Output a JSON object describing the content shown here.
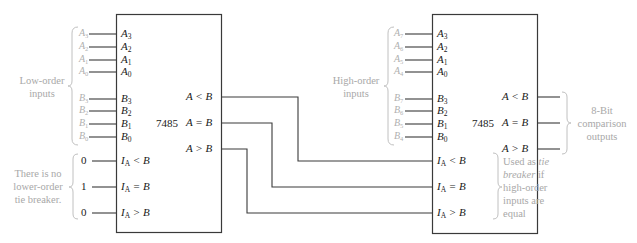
{
  "chips": [
    {
      "id": "low",
      "name": "7485",
      "inputs": [
        {
          "pin": "A",
          "sub": "3",
          "ext": "A",
          "ext_sub": "3"
        },
        {
          "pin": "A",
          "sub": "2",
          "ext": "A",
          "ext_sub": "2"
        },
        {
          "pin": "A",
          "sub": "1",
          "ext": "A",
          "ext_sub": "1"
        },
        {
          "pin": "A",
          "sub": "0",
          "ext": "A",
          "ext_sub": "0"
        },
        {
          "pin": "B",
          "sub": "3",
          "ext": "B",
          "ext_sub": "3"
        },
        {
          "pin": "B",
          "sub": "2",
          "ext": "B",
          "ext_sub": "2"
        },
        {
          "pin": "B",
          "sub": "1",
          "ext": "B",
          "ext_sub": "1"
        },
        {
          "pin": "B",
          "sub": "0",
          "ext": "B",
          "ext_sub": "0"
        }
      ],
      "cascade_inputs": [
        {
          "label": "I",
          "sub": "A",
          "op": "< B",
          "value": "0"
        },
        {
          "label": "I",
          "sub": "A",
          "op": "= B",
          "value": "1"
        },
        {
          "label": "I",
          "sub": "A",
          "op": "> B",
          "value": "0"
        }
      ],
      "outputs": [
        "A < B",
        "A = B",
        "A > B"
      ],
      "input_group_label": [
        "Low-order",
        "inputs"
      ],
      "cascade_group_label": [
        "There is no",
        "lower-order",
        "tie breaker."
      ]
    },
    {
      "id": "high",
      "name": "7485",
      "inputs": [
        {
          "pin": "A",
          "sub": "3",
          "ext": "A",
          "ext_sub": "7"
        },
        {
          "pin": "A",
          "sub": "2",
          "ext": "A",
          "ext_sub": "6"
        },
        {
          "pin": "A",
          "sub": "1",
          "ext": "A",
          "ext_sub": "5"
        },
        {
          "pin": "A",
          "sub": "0",
          "ext": "A",
          "ext_sub": "4"
        },
        {
          "pin": "B",
          "sub": "3",
          "ext": "B",
          "ext_sub": "7"
        },
        {
          "pin": "B",
          "sub": "2",
          "ext": "B",
          "ext_sub": "6"
        },
        {
          "pin": "B",
          "sub": "1",
          "ext": "B",
          "ext_sub": "5"
        },
        {
          "pin": "B",
          "sub": "0",
          "ext": "B",
          "ext_sub": "4"
        }
      ],
      "cascade_inputs": [
        {
          "label": "I",
          "sub": "A",
          "op": "< B"
        },
        {
          "label": "I",
          "sub": "A",
          "op": "= B"
        },
        {
          "label": "I",
          "sub": "A",
          "op": "> B"
        }
      ],
      "outputs": [
        "A < B",
        "A = B",
        "A > B"
      ],
      "input_group_label": [
        "High-order",
        "inputs"
      ],
      "cascade_note": {
        "prefix": "Used as ",
        "italic": "tie breaker",
        "suffix": " if high-order inputs are equal"
      },
      "output_group_label": [
        "8-Bit",
        "comparison",
        "outputs"
      ]
    }
  ],
  "colors": {
    "line": "#2a2a2a",
    "annotation": "#b0b0b0",
    "text": "#1a1a1a"
  }
}
